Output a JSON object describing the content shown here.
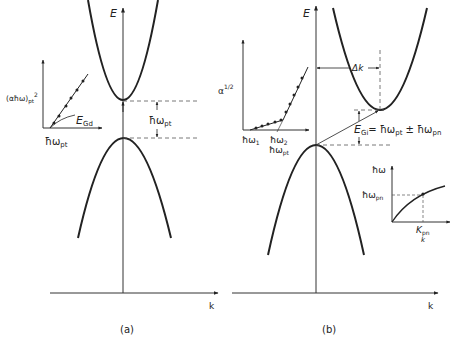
{
  "panels": {
    "a": {
      "caption": "(a)",
      "energy_axis_label": "E",
      "k_axis_label": "k",
      "gap_label": "ħω",
      "gap_label_sub": "pt",
      "inset": {
        "y_label": "(αħω)",
        "y_label_sub": "pt",
        "y_label_sup": "2",
        "x_label": "ħω",
        "x_label_sub": "pt",
        "curve_label": "E",
        "curve_label_sub": "Gd"
      }
    },
    "b": {
      "caption": "(b)",
      "energy_axis_label": "E",
      "k_axis_label": "k",
      "delta_k_label": "Δk",
      "gap_eq_label": "E",
      "gap_eq_sub": "Gi",
      "gap_eq_rhs": "= ħω",
      "gap_eq_rhs_sub1": "pt",
      "gap_eq_pm": " ± ħω",
      "gap_eq_rhs_sub2": "pn",
      "absorption_inset": {
        "y_label": "α",
        "y_label_sup": "1/2",
        "x_tick1": "ħω",
        "x_tick1_sub": "1",
        "x_tick2": "ħω",
        "x_tick2_sub": "2",
        "x_label": "ħω",
        "x_label_sub": "pt"
      },
      "phonon_inset": {
        "y_label": "ħω",
        "y_tick": "ħω",
        "y_tick_sub": "pn",
        "x_tick": "K",
        "x_tick_sub": "pn",
        "x_label": "k"
      }
    }
  },
  "colors": {
    "line": "#222222",
    "axis": "#333333",
    "dashed": "#555555"
  }
}
